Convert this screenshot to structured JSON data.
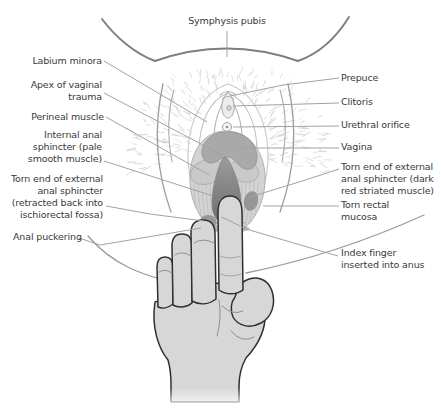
{
  "annotations": {
    "top": {
      "id": "symphysis-pubis",
      "text": "Symphysis pubis"
    },
    "left": [
      {
        "id": "labium-minora",
        "text": "Labium minora"
      },
      {
        "id": "apex-of-vaginal-trauma",
        "text": "Apex of vaginal\ntrauma"
      },
      {
        "id": "perineal-muscle",
        "text": "Perineal muscle"
      },
      {
        "id": "internal-anal-sphincter",
        "text": "Internal anal\nsphincter (pale\nsmooth muscle)"
      },
      {
        "id": "torn-external-sphincter-retracted",
        "text": "Torn end of external\nanal sphincter\n(retracted back into\nischiorectal fossa)"
      },
      {
        "id": "anal-puckering",
        "text": "Anal puckering"
      }
    ],
    "right": [
      {
        "id": "prepuce",
        "text": "Prepuce"
      },
      {
        "id": "clitoris",
        "text": "Clitoris"
      },
      {
        "id": "urethral-orifice",
        "text": "Urethral orifice"
      },
      {
        "id": "vagina",
        "text": "Vagina"
      },
      {
        "id": "torn-external-sphincter-dark",
        "text": "Torn end of external\nanal sphincter (dark\nred striated muscle)"
      },
      {
        "id": "torn-rectal-mucosa",
        "text": "Torn rectal\nmucosa"
      },
      {
        "id": "index-finger",
        "text": "Index finger\ninserted into anus"
      }
    ]
  },
  "colors": {
    "background": "#ffffff",
    "label_text": "#3a3a3a",
    "leader_line": "#a2a2a2",
    "body_outline": "#7e7e7e",
    "pubic_hair": "#c9c9c9",
    "skin_fill": "#d7d7d7",
    "hand_outline": "#2f2f2f",
    "vagina_lobe": "#a9a9a9",
    "pale_muscle_lobe": "#c9c9c9",
    "sphincter_pale": "#d3d3d3",
    "trauma_dark_top": "#9b9b9b",
    "trauma_dark_bottom": "#6b6b6b",
    "torn_sphincter_blob": "#969696"
  }
}
